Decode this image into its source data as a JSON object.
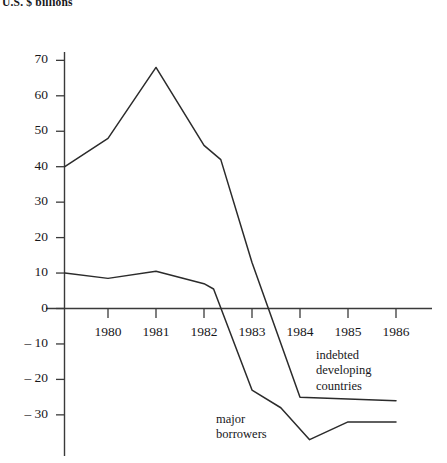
{
  "chart_data": {
    "type": "line",
    "title": "U.S. $ billions",
    "xlabel": "",
    "ylabel": "",
    "xlim": [
      1979.1,
      1986.75
    ],
    "ylim": [
      -41,
      74
    ],
    "grid": false,
    "legend_position": "inline-annotation",
    "x_ticks": [
      1980,
      1981,
      1982,
      1983,
      1984,
      1985,
      1986
    ],
    "x_tick_labels": [
      "1980",
      "1981",
      "1982",
      "1983",
      "1984",
      "1985",
      "1986"
    ],
    "y_ticks": [
      70,
      60,
      50,
      40,
      30,
      20,
      10,
      0,
      -10,
      -20,
      -30
    ],
    "y_tick_labels": [
      "70",
      "60",
      "50",
      "40",
      "30",
      "20",
      "10",
      "0",
      "– 10",
      "– 20",
      "– 30"
    ],
    "series": [
      {
        "name": "indebted developing countries",
        "x": [
          1979.1,
          1980,
          1981,
          1982,
          1982.35,
          1983,
          1984,
          1985,
          1986
        ],
        "values": [
          40,
          48,
          68,
          46,
          42,
          13,
          -25,
          -25.5,
          -26
        ]
      },
      {
        "name": "major borrowers",
        "x": [
          1979.1,
          1980,
          1981,
          1982,
          1982.2,
          1983,
          1983.6,
          1984.2,
          1985,
          1986
        ],
        "values": [
          10,
          8.5,
          10.5,
          7,
          5.5,
          -23,
          -28,
          -37,
          -32,
          -32
        ]
      }
    ],
    "annotations": [
      {
        "name": "indebted developing countries",
        "lines": [
          "indebted",
          "developing",
          "countries"
        ]
      },
      {
        "name": "major borrowers",
        "lines": [
          "major",
          "borrowers"
        ]
      }
    ]
  }
}
